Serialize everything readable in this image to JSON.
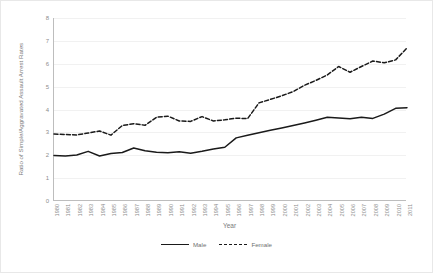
{
  "chart_data": {
    "type": "line",
    "title": "",
    "xlabel": "Year",
    "ylabel": "Ratio of Simple/Aggravated Assault Arrest Rates",
    "ylim": [
      0,
      8
    ],
    "yticks": [
      0,
      1,
      2,
      3,
      4,
      5,
      6,
      7,
      8
    ],
    "grid": true,
    "legend_position": "bottom",
    "x": [
      1980,
      1981,
      1982,
      1983,
      1984,
      1985,
      1986,
      1987,
      1988,
      1989,
      1990,
      1991,
      1992,
      1993,
      1994,
      1995,
      1996,
      1997,
      1998,
      1999,
      2000,
      2001,
      2002,
      2003,
      2004,
      2005,
      2006,
      2007,
      2008,
      2009,
      2010,
      2011
    ],
    "categories": [
      "1980",
      "1981",
      "1982",
      "1983",
      "1984",
      "1985",
      "1986",
      "1987",
      "1988",
      "1989",
      "1990",
      "1991",
      "1992",
      "1993",
      "1994",
      "1995",
      "1996",
      "1997",
      "1998",
      "1999",
      "2000",
      "2001",
      "2002",
      "2003",
      "2004",
      "2005",
      "2006",
      "2007",
      "2008",
      "2009",
      "2010",
      "2011"
    ],
    "series": [
      {
        "name": "Male",
        "style": "solid",
        "color": "#1a1a1a",
        "values": [
          1.99,
          1.97,
          2.01,
          2.17,
          1.97,
          2.08,
          2.12,
          2.32,
          2.2,
          2.13,
          2.11,
          2.15,
          2.09,
          2.17,
          2.27,
          2.35,
          2.76,
          2.87,
          2.98,
          3.09,
          3.19,
          3.3,
          3.41,
          3.53,
          3.66,
          3.63,
          3.6,
          3.66,
          3.61,
          3.8,
          4.05,
          4.08
        ]
      },
      {
        "name": "Female",
        "style": "dashed",
        "color": "#1a1a1a",
        "values": [
          2.93,
          2.91,
          2.89,
          2.97,
          3.06,
          2.88,
          3.3,
          3.38,
          3.31,
          3.66,
          3.71,
          3.5,
          3.48,
          3.69,
          3.5,
          3.55,
          3.62,
          3.6,
          4.29,
          4.44,
          4.6,
          4.78,
          5.06,
          5.27,
          5.51,
          5.88,
          5.63,
          5.88,
          6.12,
          6.04,
          6.17,
          6.69
        ]
      }
    ],
    "legend": [
      {
        "label": "Male",
        "style": "solid"
      },
      {
        "label": "Female",
        "style": "dashed"
      }
    ]
  }
}
